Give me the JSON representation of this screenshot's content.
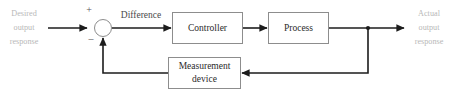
{
  "diagram": {
    "background_color": "#ffffff",
    "line_color": "#1c1c1c",
    "box_border_color": "#8d8d8d",
    "box_text_color": "#2a2a2a",
    "io_text_color": "#b8b8b8",
    "edge_text_color": "#4a4a4a"
  },
  "io": {
    "input": {
      "line1": "Desired",
      "line2": "output",
      "line3": "response"
    },
    "output": {
      "line1": "Actual",
      "line2": "output",
      "line3": "response"
    }
  },
  "summing_junction": {
    "name": "summing-junction",
    "plus_sign": "+",
    "minus_sign": "–"
  },
  "edges": {
    "difference_label": "Difference"
  },
  "blocks": [
    {
      "id": "controller",
      "label": "Controller",
      "lines": [
        "Controller"
      ]
    },
    {
      "id": "process",
      "label": "Process",
      "lines": [
        "Process"
      ]
    },
    {
      "id": "measurement-device",
      "label": "Measurement device",
      "lines": [
        "Measurement",
        "device"
      ]
    }
  ]
}
